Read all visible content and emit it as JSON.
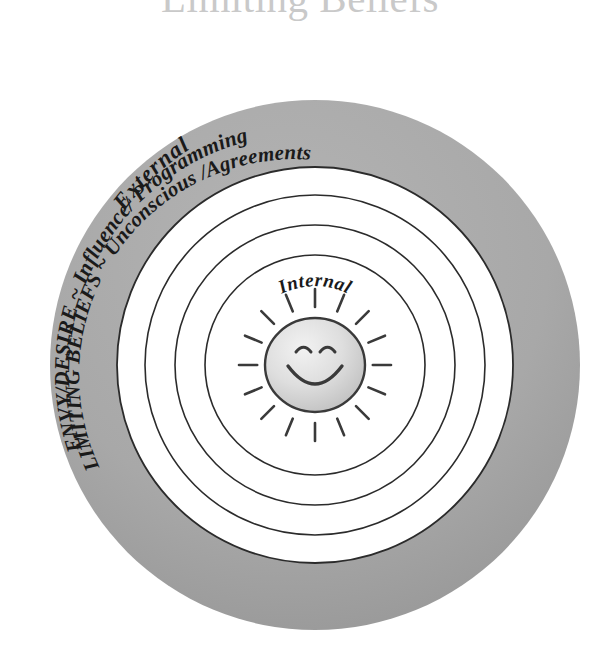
{
  "page": {
    "title": "Limiting Beliefs",
    "background_color": "#ffffff",
    "title_color": "#c9c9c9"
  },
  "diagram": {
    "name": "limiting-beliefs-concentric-circles",
    "type": "concentric-circle-diagram",
    "center": {
      "x": 315,
      "y": 365
    },
    "outer_band_color": "#a8a8a8",
    "ring_line_color": "#2b2b2b",
    "inner_fill_color": "#ffffff",
    "labels": {
      "outer_zone": "External",
      "inner_zone": "Internal",
      "band_line_1": "ENVY/DESIRE ~ Influence/ Programming",
      "band_line_2": "LIMITING BELIEFS ~ Unconscious /Agreements"
    },
    "rings": [
      {
        "name": "outer-gray-band-outer-edge",
        "radius": 265,
        "stroke": "none",
        "fill": "#a8a8a8"
      },
      {
        "name": "outer-gray-band-inner-edge",
        "radius": 198,
        "stroke": "#2b2b2b",
        "fill": "#ffffff"
      },
      {
        "name": "ring-3",
        "radius": 170,
        "stroke": "#2b2b2b",
        "fill": "none"
      },
      {
        "name": "ring-2",
        "radius": 140,
        "stroke": "#2b2b2b",
        "fill": "none"
      },
      {
        "name": "ring-1",
        "radius": 110,
        "stroke": "#2b2b2b",
        "fill": "none"
      }
    ],
    "center_icon": {
      "name": "smiley-sun-icon",
      "face_radius": 48,
      "face_fill": "#d6d6d6",
      "ray_count": 16,
      "ray_color": "#3a3a3a",
      "expression": "smiling"
    }
  }
}
